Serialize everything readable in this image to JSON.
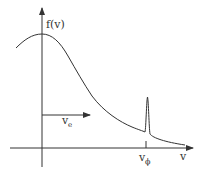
{
  "diagram": {
    "labels": {
      "y_axis": "f(v)",
      "x_axis": "v",
      "arrow_label_main": "v",
      "arrow_label_sub": "e",
      "tick_label_main": "v",
      "tick_label_sub": "ϕ"
    },
    "colors": {
      "stroke": "#333333",
      "background": "#ffffff"
    }
  }
}
